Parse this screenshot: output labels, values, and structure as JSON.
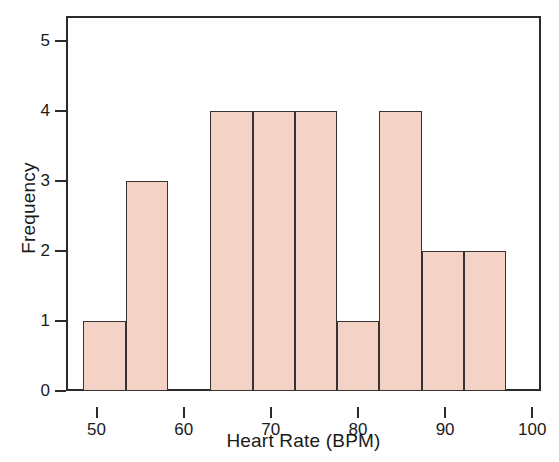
{
  "chart_data": {
    "type": "bar",
    "title": "",
    "subtitle": "",
    "xlabel": "Heart Rate (BPM)",
    "ylabel": "Frequency",
    "xlim": [
      46.5,
      101.0
    ],
    "ylim": [
      0,
      5.35
    ],
    "xticks": [
      50,
      60,
      70,
      80,
      90,
      100
    ],
    "xtick_labels": [
      "50",
      "60",
      "70",
      "80",
      "90",
      "100"
    ],
    "yticks": [
      0,
      1,
      2,
      3,
      4,
      5
    ],
    "ytick_labels": [
      "0",
      "1",
      "2",
      "3",
      "4",
      "5"
    ],
    "grid": false,
    "legend": null,
    "bin_width": 4.85,
    "bin_edges": [
      48.5,
      53.35,
      58.2,
      63.05,
      67.9,
      72.75,
      77.6,
      82.45,
      87.3,
      92.15,
      97.0
    ],
    "categories": [
      "48.5-53.3",
      "53.3-58.2",
      "58.2-63.1",
      "63.1-67.9",
      "67.9-72.8",
      "72.8-77.6",
      "77.6-82.5",
      "82.5-87.3",
      "87.3-92.2",
      "92.2-97.0"
    ],
    "values": [
      1,
      3,
      0,
      4,
      4,
      4,
      1,
      4,
      2,
      2
    ],
    "bar_color": "#f4d3c6",
    "bar_edge_color": "#3a3230",
    "total_count": 25
  },
  "axes": {
    "y_title": "Frequency",
    "x_title": "Heart Rate (BPM)"
  }
}
